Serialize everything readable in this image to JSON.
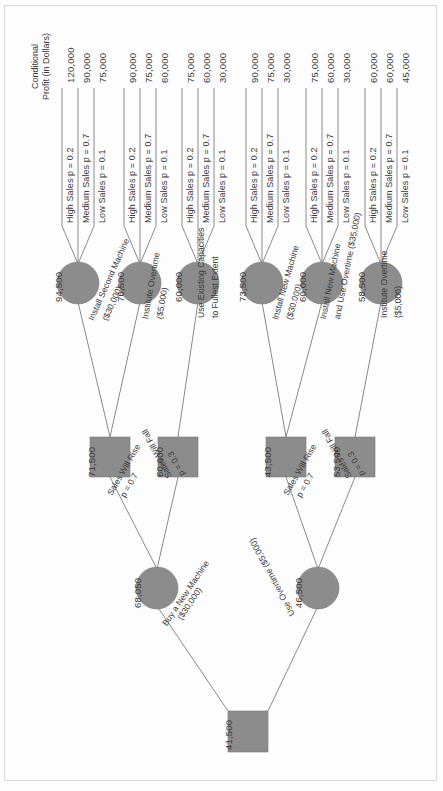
{
  "title_block": {
    "line1": "Conditional",
    "line2": "Profit (in Dollars)"
  },
  "colors": {
    "node_fill": "#8c8c8c",
    "edge": "#8a8a8a",
    "text": "#3b3b3b",
    "background": "#fdfdfd"
  },
  "outcomes": [
    {
      "label": "High Sales p = 0.2",
      "payoff": "120,000"
    },
    {
      "label": "Medium Sales p = 0.7",
      "payoff": "90,000"
    },
    {
      "label": "Low Sales p = 0.1",
      "payoff": "75,000"
    },
    {
      "label": "High Sales p = 0.2",
      "payoff": "90,000"
    },
    {
      "label": "Medium Sales p = 0.7",
      "payoff": "75,000"
    },
    {
      "label": "Low Sales p = 0.1",
      "payoff": "60,000"
    },
    {
      "label": "High Sales p = 0.2",
      "payoff": "75,000"
    },
    {
      "label": "Medium Sales p = 0.7",
      "payoff": "60,000"
    },
    {
      "label": "Low Sales p = 0.1",
      "payoff": "30,000"
    },
    {
      "label": "High Sales p = 0.2",
      "payoff": "90,000"
    },
    {
      "label": "Medium Sales p = 0.7",
      "payoff": "75,000"
    },
    {
      "label": "Low Sales p = 0.1",
      "payoff": "30,000"
    },
    {
      "label": "High Sales p = 0.2",
      "payoff": "75,000"
    },
    {
      "label": "Medium Sales p = 0.7",
      "payoff": "60,000"
    },
    {
      "label": "Low Sales p = 0.1",
      "payoff": "30,000"
    },
    {
      "label": "High Sales p = 0.2",
      "payoff": "60,000"
    },
    {
      "label": "Medium Sales p = 0.7",
      "payoff": "60,000"
    },
    {
      "label": "Low Sales p = 0.1",
      "payoff": "45,000"
    }
  ],
  "chance_nodes": [
    {
      "value": "94,500"
    },
    {
      "value": "76,500"
    },
    {
      "value": "60,000"
    },
    {
      "value": "73,500"
    },
    {
      "value": "60,000"
    },
    {
      "value": "58,500"
    }
  ],
  "decision_nodes": [
    {
      "value": "71,500"
    },
    {
      "value": "60,000"
    },
    {
      "value": "43,500"
    },
    {
      "value": "53,500"
    }
  ],
  "state_nodes": [
    {
      "value": "68,050"
    },
    {
      "value": "46,500"
    }
  ],
  "root_node": {
    "value": "41,500"
  },
  "decision_edges": [
    {
      "line1": "Install Second Machine",
      "line2": "($30,000)"
    },
    {
      "line1": "Institute Overtime",
      "line2": "($5,000)"
    },
    {
      "line1": "Use Existing Capacities",
      "line2": "to Fullest Extent"
    },
    {
      "line1": "Install New Machine",
      "line2": "($30,000)"
    },
    {
      "line1": "Install New Machine",
      "line2": "and Use Overtime ($35,000)"
    },
    {
      "line1": "Institute Overtime",
      "line2": "($5,000)"
    }
  ],
  "state_edges": [
    {
      "name": "Sales Will Rise",
      "prob": "p = 0.7"
    },
    {
      "name": "Sales Will Fall",
      "prob": "p = 0.3"
    },
    {
      "name": "Sales Will Rise",
      "prob": "p = 0.7"
    },
    {
      "name": "Sales Will Fall",
      "prob": "p = 0.3"
    }
  ],
  "root_edges": [
    {
      "label": "Buy a New Machine",
      "cost": "($30,000)"
    },
    {
      "label": "Use Overtime ($5,000)",
      "cost": ""
    }
  ]
}
